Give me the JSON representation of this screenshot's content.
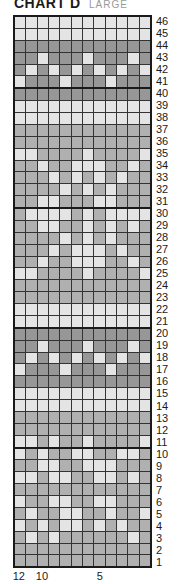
{
  "title": {
    "main": "CHART D",
    "sub": "LARGE"
  },
  "legend_colors": {
    "L": "#e4e4e4",
    "M": "#b0b0b0",
    "D": "#979797"
  },
  "columns": 12,
  "column_labels": [
    {
      "label": "12",
      "col": 12
    },
    {
      "label": "10",
      "col": 10
    },
    {
      "label": "5",
      "col": 5
    }
  ],
  "thick_after_rows": [
    41,
    31,
    21,
    11
  ],
  "rows": [
    {
      "n": "46",
      "cells": "LLLLLLLLLLLL"
    },
    {
      "n": "45",
      "cells": "LLLLLLLLLLLL"
    },
    {
      "n": "44",
      "cells": "DDDDDDDDDDDD"
    },
    {
      "n": "43",
      "cells": "DDLDDDLDDDLD"
    },
    {
      "n": "42",
      "cells": "DLDLDLDLDLDL"
    },
    {
      "n": "41",
      "cells": "LDDDLDDDLDDD"
    },
    {
      "n": "40",
      "cells": "DDDDDDDDDDDD"
    },
    {
      "n": "39",
      "cells": "LLLLLLLLLLLL"
    },
    {
      "n": "38",
      "cells": "LLLLLLLLLLLL"
    },
    {
      "n": "37",
      "cells": "MMMMMMMMMMMM"
    },
    {
      "n": "36",
      "cells": "MMMMMMMMMMMM"
    },
    {
      "n": "35",
      "cells": "LLMMMMLMMMML"
    },
    {
      "n": "34",
      "cells": "MMLMMLLLMMLM"
    },
    {
      "n": "33",
      "cells": "MMMLMLMLMLMM"
    },
    {
      "n": "32",
      "cells": "MMMMLMLMLMMM"
    },
    {
      "n": "31",
      "cells": "MMLLMMMLLMMM"
    },
    {
      "n": "30",
      "cells": "MLLLLMLMLLLL"
    },
    {
      "n": "29",
      "cells": "MMLLMMLMLMLM"
    },
    {
      "n": "28",
      "cells": "MMMMLMLMLMMM"
    },
    {
      "n": "27",
      "cells": "MMMLMLLLMLMM"
    },
    {
      "n": "26",
      "cells": "MMLMMLLLMMLM"
    },
    {
      "n": "25",
      "cells": "LLMMMMLMMMML"
    },
    {
      "n": "24",
      "cells": "MMMMMMMMMMMM"
    },
    {
      "n": "23",
      "cells": "MMMMMMMMMMMM"
    },
    {
      "n": "22",
      "cells": "LLLLLLLLLLLL"
    },
    {
      "n": "21",
      "cells": "LLLLLLLLLLLL"
    },
    {
      "n": "20",
      "cells": "DDDDDDDDDDDD"
    },
    {
      "n": "19",
      "cells": "DDLDDDLDDDLD"
    },
    {
      "n": "18",
      "cells": "DLDLDLDLDLDL"
    },
    {
      "n": "17",
      "cells": "LDDDLDDDLDDD"
    },
    {
      "n": "16",
      "cells": "DDDDDDDDDDDD"
    },
    {
      "n": "15",
      "cells": "LLLLLLLLLLLL"
    },
    {
      "n": "14",
      "cells": "LLLLLLLLLLLL"
    },
    {
      "n": "13",
      "cells": "MMMMMMMMMMMM"
    },
    {
      "n": "12",
      "cells": "MMMMMMMMMMMM"
    },
    {
      "n": "11",
      "cells": "LLMLMMLMMMML"
    },
    {
      "n": "10",
      "cells": "LMLMMLLMMLLM"
    },
    {
      "n": "9",
      "cells": "MMLLMMLLLMMM"
    },
    {
      "n": "8",
      "cells": "LLMLLMMLLMLM"
    },
    {
      "n": "7",
      "cells": "MMMMMMMMMMMM"
    },
    {
      "n": "6",
      "cells": "LMMLLMMLLMMM"
    },
    {
      "n": "5",
      "cells": "MLMMLLMMLMML"
    },
    {
      "n": "4",
      "cells": "LMLMLLMLMLMM"
    },
    {
      "n": "3",
      "cells": "MLMLMMMMMMLM"
    },
    {
      "n": "2",
      "cells": "MMMMMMMMMMMM"
    },
    {
      "n": "1",
      "cells": "MMMMMMMMMMMM"
    }
  ]
}
